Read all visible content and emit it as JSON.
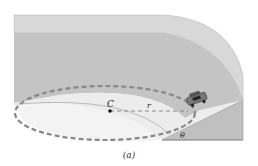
{
  "diagram": {
    "labels": {
      "center": "C",
      "radius": "r",
      "angle": "θ",
      "caption": "(a)"
    },
    "colors": {
      "background": "#ffffff",
      "top_rim": "#d6d6d6",
      "outer_wall": "#c2c2c2",
      "bank_surface": "#ededed",
      "ramp_side": "#bdbdbd",
      "dashed_path": "#888888",
      "car": "#555555"
    },
    "elements": [
      "circular banked track",
      "dashed circular path of car",
      "center point C",
      "radius line r",
      "car on track",
      "bank angle θ"
    ]
  }
}
